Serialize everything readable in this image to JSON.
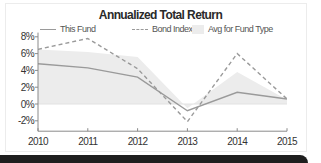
{
  "chart_data": {
    "type": "line",
    "title": "Annualized Total Return",
    "xlabel": "",
    "ylabel": "",
    "categories": [
      "2010",
      "2011",
      "2012",
      "2013",
      "2014",
      "2015"
    ],
    "series": [
      {
        "name": "This Fund",
        "style": "solid-line",
        "values": [
          4.8,
          4.3,
          3.2,
          -0.8,
          1.4,
          0.6
        ]
      },
      {
        "name": "Bond Index",
        "style": "dashed-line",
        "values": [
          6.5,
          7.8,
          4.2,
          -2.1,
          6.0,
          0.6
        ]
      },
      {
        "name": "Avg for Fund Type",
        "style": "area",
        "values": [
          6.5,
          6.2,
          5.6,
          -0.5,
          3.8,
          0.5
        ]
      }
    ],
    "ylim": [
      -3,
      8.5
    ],
    "yticks": [
      8,
      6,
      4,
      2,
      0,
      -2
    ],
    "ytick_labels": [
      "8%",
      "6%",
      "4%",
      "2%",
      "0%",
      "-2%"
    ],
    "grid": false,
    "legend": "top"
  },
  "colors": {
    "line": "#9a9a9a",
    "area": "#ececec",
    "axis": "#8a8a8a"
  },
  "footer_bar": {}
}
